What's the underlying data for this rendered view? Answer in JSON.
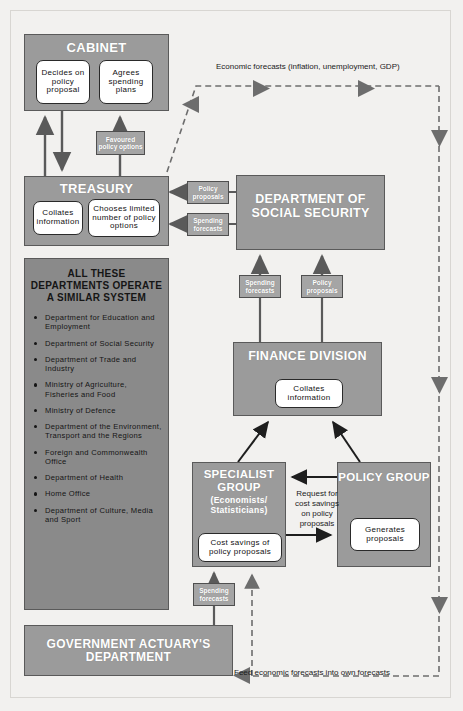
{
  "diagram": {
    "colors": {
      "box_fill": "#9b9b9b",
      "box_fill_dark": "#8a8a8a",
      "box_border": "#5a5a5a",
      "tag_fill": "#a5a5a5",
      "inner_fill": "#ffffff",
      "page_bg": "#f2f1ef",
      "text_dark": "#151515",
      "text_light": "#ffffff"
    }
  },
  "cabinet": {
    "title": "CABINET",
    "inner": [
      "Decides on policy proposal",
      "Agrees spending plans"
    ]
  },
  "treasury": {
    "title": "TREASURY",
    "inner": [
      "Collates information",
      "Chooses limited number of policy options"
    ]
  },
  "departments": {
    "heading": "ALL THESE DEPARTMENTS OPERATE A SIMILAR SYSTEM",
    "items": [
      "Department for Education and Employment",
      "Department of Social Security",
      "Department of Trade and Industry",
      "Ministry of Agriculture, Fisheries and Food",
      "Ministry of Defence",
      "Department of the Environment, Transport and the Regions",
      "Foreign and Commonwealth Office",
      "Department of Health",
      "Home Office",
      "Department of Culture, Media and Sport"
    ]
  },
  "dss": {
    "title": "DEPARTMENT OF SOCIAL SECURITY"
  },
  "finance": {
    "title": "FINANCE DIVISION",
    "inner": "Collates information"
  },
  "specialist": {
    "title": "SPECIALIST GROUP",
    "subtitle": "(Economists/ Statisticians)",
    "inner": "Cost savings of policy proposals"
  },
  "policy_group": {
    "title": "POLICY GROUP",
    "inner": "Generates proposals"
  },
  "gad": {
    "title": "GOVERNMENT ACTUARY'S DEPARTMENT"
  },
  "tags": {
    "favoured_policy_options": "Favoured policy options",
    "policy_proposals": "Policy proposals",
    "spending_forecasts": "Spending forecasts"
  },
  "notes": {
    "economic_forecasts": "Economic forecasts (inflation, unemployment, GDP)",
    "request": "Request for cost savings on policy proposals",
    "feed_forecasts": "Feed economic forecasts into own forecasts"
  }
}
